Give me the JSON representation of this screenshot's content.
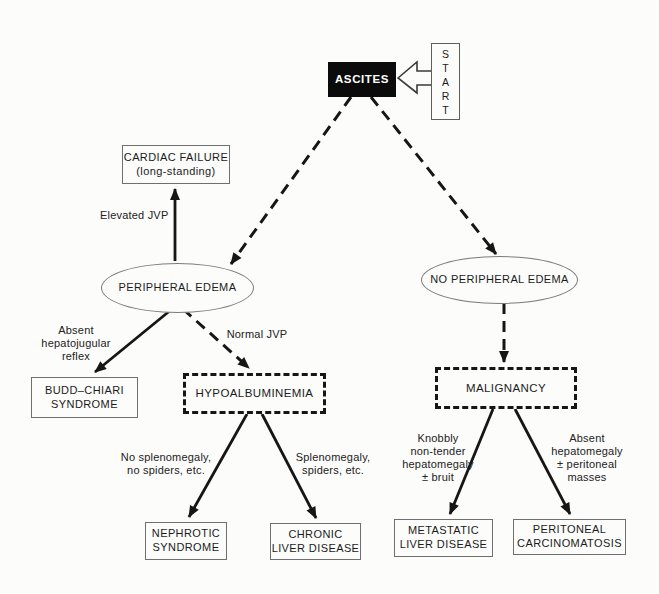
{
  "diagram": {
    "colors": {
      "ink": "#161616",
      "node_fill": "#fcfcfa",
      "ascites_fill": "#0b0b0b",
      "ascites_text": "#ffffff"
    },
    "nodes": {
      "start": {
        "label": "START",
        "letters": [
          "S",
          "T",
          "A",
          "R",
          "T"
        ]
      },
      "ascites": {
        "label": "ASCITES"
      },
      "cardiac_failure": {
        "label": "CARDIAC FAILURE\n(long-standing)"
      },
      "peripheral_edema": {
        "label": "PERIPHERAL EDEMA"
      },
      "no_peripheral_edema": {
        "label": "NO PERIPHERAL EDEMA"
      },
      "budd_chiari": {
        "label": "BUDD–CHIARI\nSYNDROME"
      },
      "hypoalbuminemia": {
        "label": "HYPOALBUMINEMIA"
      },
      "malignancy": {
        "label": "MALIGNANCY"
      },
      "nephrotic": {
        "label": "NEPHROTIC\nSYNDROME"
      },
      "chronic_liver": {
        "label": "CHRONIC\nLIVER DISEASE"
      },
      "metastatic_liver": {
        "label": "METASTATIC\nLIVER DISEASE"
      },
      "peritoneal": {
        "label": "PERITONEAL\nCARCINOMATOSIS"
      }
    },
    "edge_labels": {
      "elevated_jvp": "Elevated JVP",
      "absent_hepatojugular": "Absent\nhepatojugular\nreflex",
      "normal_jvp": "Normal JVP",
      "no_splenomegaly": "No splenomegaly,\nno spiders, etc.",
      "splenomegaly": "Splenomegaly,\nspiders, etc.",
      "knobbly": "Knobbly\nnon-tender\nhepatomegaly\n± bruit",
      "absent_hepatomegaly": "Absent\nhepatomegaly\n± peritoneal\nmasses"
    }
  }
}
